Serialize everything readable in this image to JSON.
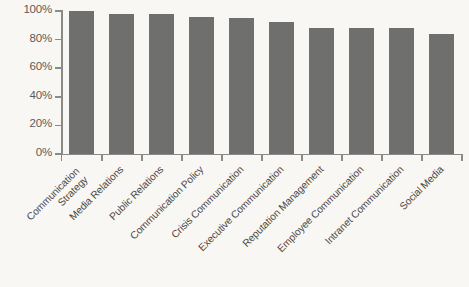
{
  "chart_data": {
    "type": "bar",
    "title": "",
    "subtitle": "",
    "xlabel": "",
    "ylabel": "",
    "categories": [
      "Communication Strategy",
      "Media Relations",
      "Public Relations",
      "Communication Policy",
      "Crisis Communication",
      "Executive Communication",
      "Reputation Management",
      "Employee Communication",
      "Intranet Communication",
      "Social Media"
    ],
    "category_lines": [
      [
        "Communication",
        "Strategy"
      ],
      [
        "Media Relations"
      ],
      [
        "Public Relations"
      ],
      [
        "Communication Policy"
      ],
      [
        "Crisis Communication"
      ],
      [
        "Executive Communication"
      ],
      [
        "Reputation Management"
      ],
      [
        "Employee Communication"
      ],
      [
        "Intranet Communication"
      ],
      [
        "Social Media"
      ]
    ],
    "values": [
      100,
      98,
      98,
      96,
      95,
      92,
      88,
      88,
      88,
      84
    ],
    "ylim": [
      0,
      100
    ],
    "ytick_values": [
      0,
      20,
      40,
      60,
      80,
      100
    ],
    "ytick_labels": [
      "0%",
      "20%",
      "40%",
      "60%",
      "80%",
      "100%"
    ],
    "grid": false,
    "legend": false,
    "legend_position": "none",
    "bar_color": "#6f6f6d",
    "axis_color": "#8a8a88",
    "background_color": "#f8f7f4",
    "tick_label_color": "#5b5b59",
    "category_label_color": "#4a4a48",
    "category_label_rotation": -45
  }
}
